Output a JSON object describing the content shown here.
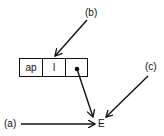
{
  "diagram": {
    "labels": {
      "a": "(a)",
      "b": "(b)",
      "c": "(c)"
    },
    "node": {
      "cells": [
        "ap",
        "l",
        "•"
      ]
    },
    "target": "E",
    "edges": [
      {
        "from": "(b)",
        "to": "cell l"
      },
      {
        "from": "cell •",
        "to": "E"
      },
      {
        "from": "(c)",
        "to": "E"
      },
      {
        "from": "(a)",
        "to": "E"
      }
    ],
    "colors": {
      "ink": "#111111",
      "background": "#ffffff"
    }
  }
}
